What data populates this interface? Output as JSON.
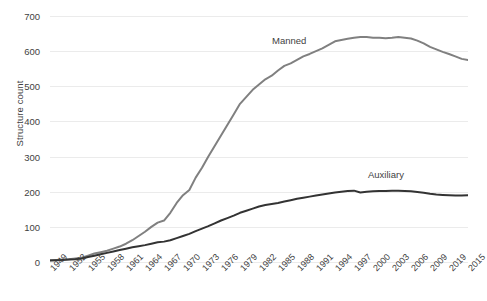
{
  "chart_data": {
    "type": "line",
    "title": "",
    "xlabel": "",
    "ylabel": "Structure count",
    "ylim": [
      0,
      700
    ],
    "ytick_step": 100,
    "ytick_labels": [
      "0",
      "100",
      "200",
      "300",
      "400",
      "500",
      "600",
      "700"
    ],
    "grid": true,
    "legend_position": "inline-annotations",
    "x": [
      1949,
      1950,
      1951,
      1952,
      1953,
      1954,
      1955,
      1956,
      1957,
      1958,
      1959,
      1960,
      1961,
      1962,
      1963,
      1964,
      1965,
      1966,
      1967,
      1968,
      1969,
      1970,
      1971,
      1972,
      1973,
      1974,
      1975,
      1976,
      1977,
      1978,
      1979,
      1980,
      1981,
      1982,
      1983,
      1984,
      1985,
      1986,
      1987,
      1988,
      1989,
      1990,
      1991,
      1992,
      1993,
      1994,
      1995,
      1996,
      1997,
      1998,
      1999,
      2000,
      2001,
      2002,
      2003,
      2004,
      2005,
      2006,
      2007,
      2008,
      2009,
      2010,
      2011,
      2012,
      2013,
      2014,
      2015
    ],
    "xtick_labels": [
      "1949",
      "1952",
      "1955",
      "1958",
      "1961",
      "1964",
      "1967",
      "1970",
      "1973",
      "1976",
      "1979",
      "1982",
      "1985",
      "1988",
      "1991",
      "1994",
      "1997",
      "2000",
      "2003",
      "2006",
      "2009",
      "2019",
      "2015"
    ],
    "series": [
      {
        "name": "Manned",
        "color": "#808080",
        "values": [
          5,
          6,
          7,
          8,
          10,
          12,
          18,
          24,
          28,
          32,
          38,
          44,
          52,
          62,
          74,
          86,
          100,
          112,
          118,
          140,
          168,
          190,
          205,
          240,
          268,
          300,
          330,
          360,
          390,
          420,
          450,
          470,
          490,
          505,
          520,
          530,
          545,
          558,
          565,
          575,
          585,
          592,
          600,
          608,
          618,
          628,
          632,
          635,
          638,
          640,
          640,
          638,
          638,
          637,
          638,
          640,
          638,
          636,
          630,
          622,
          612,
          605,
          598,
          592,
          585,
          578,
          575
        ]
      },
      {
        "name": "Auxiliary",
        "color": "#333333",
        "values": [
          4,
          5,
          6,
          7,
          8,
          10,
          14,
          18,
          22,
          26,
          30,
          34,
          38,
          42,
          45,
          48,
          52,
          56,
          58,
          62,
          68,
          74,
          80,
          88,
          95,
          102,
          110,
          118,
          125,
          132,
          140,
          146,
          152,
          158,
          162,
          165,
          168,
          172,
          176,
          180,
          183,
          186,
          189,
          192,
          195,
          198,
          200,
          202,
          203,
          198,
          200,
          201,
          202,
          202,
          203,
          203,
          202,
          201,
          199,
          197,
          194,
          192,
          191,
          190,
          189,
          189,
          190
        ]
      }
    ]
  },
  "axis": {
    "y_title": "Structure count"
  },
  "annotations": {
    "manned_label": "Manned",
    "auxiliary_label": "Auxiliary"
  }
}
